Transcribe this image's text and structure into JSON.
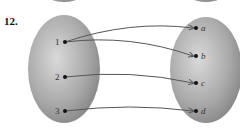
{
  "problem": {
    "number": "12."
  },
  "domain_set": {
    "elements": [
      {
        "id": "1",
        "label": "1"
      },
      {
        "id": "2",
        "label": "2"
      },
      {
        "id": "3",
        "label": "3"
      }
    ]
  },
  "codomain_set": {
    "elements": [
      {
        "id": "a",
        "label": "a"
      },
      {
        "id": "b",
        "label": "b"
      },
      {
        "id": "c",
        "label": "c"
      },
      {
        "id": "d",
        "label": "d"
      }
    ]
  },
  "mappings": [
    {
      "from": "1",
      "to": "a"
    },
    {
      "from": "1",
      "to": "b"
    },
    {
      "from": "2",
      "to": "c"
    },
    {
      "from": "3",
      "to": "d"
    }
  ],
  "colors": {
    "ellipse_light": "#d6d6d6",
    "ellipse_dark": "#8a8a8a",
    "arrow": "#555555",
    "dot": "#111111"
  }
}
